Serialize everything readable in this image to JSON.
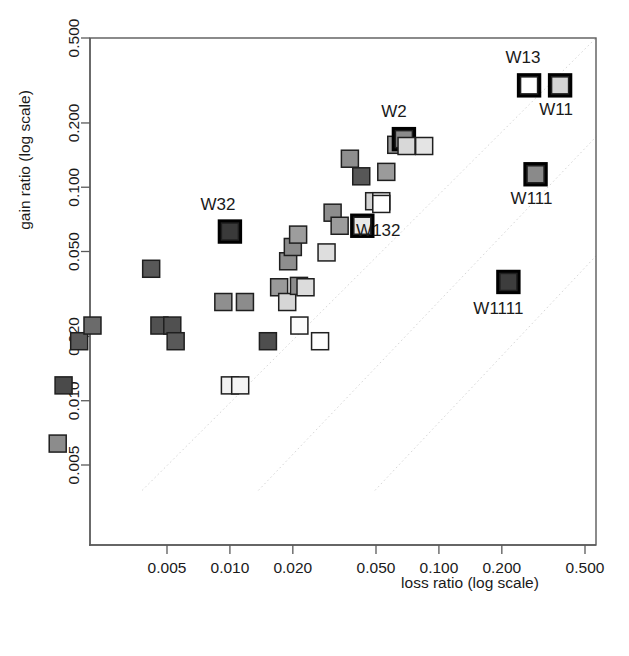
{
  "figure": {
    "background_color": "#ffffff",
    "frame_color": "#5a5a5a",
    "reference_line_color": "#d7d7d7",
    "marker_outline_color": "#1f1f1f",
    "highlight_outline_color": "#000000"
  },
  "chart_data": {
    "type": "scatter",
    "title": "",
    "xlabel": "loss ratio   (log scale)",
    "ylabel": "gain ratio   (log scale)",
    "x_scale": "log",
    "y_scale": "log",
    "grid": false,
    "legend": "none",
    "xlim": [
      0.0012,
      0.62
    ],
    "ylim": [
      0.0038,
      0.62
    ],
    "xticks": [
      0.005,
      0.01,
      0.02,
      0.05,
      0.1,
      0.2,
      0.5
    ],
    "xtick_labels": [
      "0.005",
      "0.010",
      "0.020",
      "0.050",
      "0.100",
      "0.200",
      "0.500"
    ],
    "yticks": [
      0.005,
      0.01,
      0.02,
      0.05,
      0.1,
      0.2,
      0.5
    ],
    "ytick_labels": [
      "0.005",
      "0.010",
      "0.020",
      "0.050",
      "0.100",
      "0.200",
      "0.500"
    ],
    "annotations": [
      {
        "text": "W13",
        "x": 0.27,
        "y": 0.3,
        "dx": -6,
        "dy": -22
      },
      {
        "text": "W11",
        "x": 0.38,
        "y": 0.3,
        "dx": -4,
        "dy": 30
      },
      {
        "text": "W2",
        "x": 0.068,
        "y": 0.168,
        "dx": -10,
        "dy": -22
      },
      {
        "text": "W132",
        "x": 0.043,
        "y": 0.066,
        "dx": 16,
        "dy": 10
      },
      {
        "text": "W32",
        "x": 0.01,
        "y": 0.062,
        "dx": -12,
        "dy": -22
      },
      {
        "text": "W111",
        "x": 0.29,
        "y": 0.115,
        "dx": -4,
        "dy": 30
      },
      {
        "text": "W1111",
        "x": 0.215,
        "y": 0.036,
        "dx": -10,
        "dy": 32
      }
    ],
    "reference_lines": [
      {
        "kind": "diagonal",
        "ratio": 1.0
      },
      {
        "kind": "diagonal",
        "ratio": 3.6
      },
      {
        "kind": "diagonal",
        "ratio": 13.0
      }
    ],
    "points": [
      {
        "x": 0.0015,
        "y": 0.0063,
        "fill": "#8c8c8c",
        "highlight": false,
        "label": ""
      },
      {
        "x": 0.0016,
        "y": 0.0118,
        "fill": "#4a4a4a",
        "highlight": false,
        "label": ""
      },
      {
        "x": 0.0019,
        "y": 0.019,
        "fill": "#5a5a5a",
        "highlight": false,
        "label": ""
      },
      {
        "x": 0.0022,
        "y": 0.0225,
        "fill": "#6b6b6b",
        "highlight": false,
        "label": ""
      },
      {
        "x": 0.0042,
        "y": 0.0415,
        "fill": "#585858",
        "highlight": false,
        "label": ""
      },
      {
        "x": 0.0046,
        "y": 0.0225,
        "fill": "#515151",
        "highlight": false,
        "label": ""
      },
      {
        "x": 0.0053,
        "y": 0.0225,
        "fill": "#505050",
        "highlight": false,
        "label": ""
      },
      {
        "x": 0.0055,
        "y": 0.019,
        "fill": "#595959",
        "highlight": false,
        "label": ""
      },
      {
        "x": 0.01,
        "y": 0.0118,
        "fill": "#f2f2f2",
        "highlight": false,
        "label": ""
      },
      {
        "x": 0.0112,
        "y": 0.0118,
        "fill": "#f4f4f4",
        "highlight": false,
        "label": ""
      },
      {
        "x": 0.01,
        "y": 0.062,
        "fill": "#3a3a3a",
        "highlight": true,
        "label": "W32"
      },
      {
        "x": 0.0093,
        "y": 0.029,
        "fill": "#8f8f8f",
        "highlight": false,
        "label": ""
      },
      {
        "x": 0.0118,
        "y": 0.029,
        "fill": "#8c8c8c",
        "highlight": false,
        "label": ""
      },
      {
        "x": 0.0152,
        "y": 0.019,
        "fill": "#4e4e4e",
        "highlight": false,
        "label": ""
      },
      {
        "x": 0.0172,
        "y": 0.034,
        "fill": "#9a9a9a",
        "highlight": false,
        "label": ""
      },
      {
        "x": 0.0188,
        "y": 0.029,
        "fill": "#d6d6d6",
        "highlight": false,
        "label": ""
      },
      {
        "x": 0.019,
        "y": 0.045,
        "fill": "#8e8e8e",
        "highlight": false,
        "label": ""
      },
      {
        "x": 0.02,
        "y": 0.0525,
        "fill": "#8a8a8a",
        "highlight": false,
        "label": ""
      },
      {
        "x": 0.0212,
        "y": 0.06,
        "fill": "#9d9d9d",
        "highlight": false,
        "label": ""
      },
      {
        "x": 0.0214,
        "y": 0.0345,
        "fill": "#8b8b8b",
        "highlight": false,
        "label": ""
      },
      {
        "x": 0.023,
        "y": 0.034,
        "fill": "#dcdcdc",
        "highlight": false,
        "label": ""
      },
      {
        "x": 0.0215,
        "y": 0.0225,
        "fill": "#fbfbfb",
        "highlight": false,
        "label": ""
      },
      {
        "x": 0.027,
        "y": 0.019,
        "fill": "#fdfdfd",
        "highlight": false,
        "label": ""
      },
      {
        "x": 0.029,
        "y": 0.0495,
        "fill": "#dedede",
        "highlight": false,
        "label": ""
      },
      {
        "x": 0.031,
        "y": 0.076,
        "fill": "#8d8d8d",
        "highlight": false,
        "label": ""
      },
      {
        "x": 0.0335,
        "y": 0.066,
        "fill": "#9c9c9c",
        "highlight": false,
        "label": ""
      },
      {
        "x": 0.0375,
        "y": 0.136,
        "fill": "#8e8e8e",
        "highlight": false,
        "label": ""
      },
      {
        "x": 0.042,
        "y": 0.066,
        "fill": "#cfcfcf",
        "highlight": false,
        "label": ""
      },
      {
        "x": 0.043,
        "y": 0.066,
        "fill": "#e8e8e8",
        "highlight": true,
        "label": "W132"
      },
      {
        "x": 0.0425,
        "y": 0.1125,
        "fill": "#575757",
        "highlight": false,
        "label": ""
      },
      {
        "x": 0.049,
        "y": 0.086,
        "fill": "#d3d3d3",
        "highlight": false,
        "label": ""
      },
      {
        "x": 0.053,
        "y": 0.086,
        "fill": "#fafafa",
        "highlight": false,
        "label": ""
      },
      {
        "x": 0.053,
        "y": 0.0835,
        "fill": "#ffffff",
        "highlight": false,
        "label": ""
      },
      {
        "x": 0.056,
        "y": 0.118,
        "fill": "#9b9b9b",
        "highlight": false,
        "label": ""
      },
      {
        "x": 0.0625,
        "y": 0.158,
        "fill": "#9a9a9a",
        "highlight": false,
        "label": ""
      },
      {
        "x": 0.068,
        "y": 0.168,
        "fill": "#8b8b8b",
        "highlight": true,
        "label": "W2"
      },
      {
        "x": 0.07,
        "y": 0.156,
        "fill": "#d8d8d8",
        "highlight": false,
        "label": ""
      },
      {
        "x": 0.085,
        "y": 0.156,
        "fill": "#e4e4e4",
        "highlight": false,
        "label": ""
      },
      {
        "x": 0.27,
        "y": 0.3,
        "fill": "#ffffff",
        "highlight": true,
        "label": "W13"
      },
      {
        "x": 0.38,
        "y": 0.3,
        "fill": "#d5d5d5",
        "highlight": true,
        "label": "W11"
      },
      {
        "x": 0.29,
        "y": 0.115,
        "fill": "#8a8a8a",
        "highlight": true,
        "label": "W111"
      },
      {
        "x": 0.215,
        "y": 0.036,
        "fill": "#3d3d3d",
        "highlight": true,
        "label": "W1111"
      }
    ]
  }
}
